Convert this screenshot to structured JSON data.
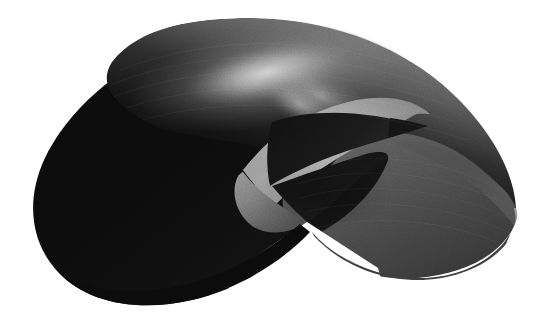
{
  "image": {
    "kind": "rendered-3d-surface",
    "title": "Self-intersecting surface render",
    "description": "Grayscale raytraced rendering of a self-intersecting closed surface (Boy's surface / cross-cap type) with two large lobes and a central triple-point region",
    "width": 544,
    "height": 319,
    "background_color": "#ffffff",
    "has_film_grain": true,
    "caption": ""
  },
  "palette": {
    "background": "#ffffff",
    "near_black": "#0a0a0a",
    "dark": "#1d1d1d",
    "dark_mid": "#2e2e2e",
    "mid": "#414141",
    "mid_light": "#555555",
    "light": "#8e8e8e",
    "bright": "#a6a6a6",
    "highlight": "#c8c8c8",
    "specular": "#e2e2e2"
  },
  "regions": [
    {
      "name": "upper-left-lobe",
      "label": "Upper left lobe (far sheet)",
      "fill_from": "#0c0c0c",
      "fill_to": "#6a6a6a",
      "note": "dark lobe with a broad diagonal specular highlight band along its upper-right flank"
    },
    {
      "name": "lower-left-lobe",
      "label": "Lower left lobe (near sheet)",
      "fill_from": "#090909",
      "fill_to": "#171717",
      "note": "almost uniformly black, large rounded lobe occupying the lower-left"
    },
    {
      "name": "right-lobe",
      "label": "Right lobe",
      "fill_from": "#565656",
      "fill_to": "#3a3a3a",
      "note": "medium grey teardrop lobe sweeping to the right, slightly darker toward the bottom"
    },
    {
      "name": "central-bright-facet",
      "label": "Central bright facet",
      "fill_from": "#aeaeae",
      "fill_to": "#8a8a8a",
      "note": "light curved triangular sheet visible through the opening near the centre"
    },
    {
      "name": "lower-bright-facet",
      "label": "Lower bright facet",
      "fill_from": "#8f8f8f",
      "fill_to": "#636363",
      "note": "secondary lighter wedge below the central facet, left of the bottom triple point"
    },
    {
      "name": "dark-wedge-upper",
      "label": "Upper dark wedge",
      "fill_from": "#141414",
      "fill_to": "#242424",
      "note": "sharp crescent-shaped dark sliver tapering to a point on the right"
    },
    {
      "name": "dark-wedge-lower",
      "label": "Lower dark wedge",
      "fill_from": "#101010",
      "fill_to": "#1c1c1c",
      "note": "dark triangular fold that meets the bottom triple point"
    },
    {
      "name": "background-notch",
      "label": "Background notch",
      "fill_from": "#ffffff",
      "fill_to": "#ffffff",
      "note": "white triangular wedge of background intruding from the bottom edge, apex near the triple point"
    }
  ],
  "key_points": [
    {
      "name": "left-extremum",
      "label": "Left silhouette extremum",
      "x": 33,
      "y": 182
    },
    {
      "name": "right-extremum",
      "label": "Right silhouette extremum",
      "x": 516,
      "y": 208
    },
    {
      "name": "top-extremum",
      "label": "Top silhouette extremum",
      "x": 250,
      "y": 18
    },
    {
      "name": "bottom-extremum",
      "label": "Bottom silhouette extremum",
      "x": 148,
      "y": 306
    },
    {
      "name": "cusp-point-right",
      "label": "Right cusp of dark sliver",
      "x": 427,
      "y": 126
    },
    {
      "name": "cusp-point-left",
      "label": "Left cusp of bright facet",
      "x": 243,
      "y": 170
    },
    {
      "name": "triple-point-centre",
      "label": "Central triple point",
      "x": 388,
      "y": 160
    },
    {
      "name": "triple-point-bottom",
      "label": "Bottom triple point",
      "x": 307,
      "y": 222
    }
  ]
}
